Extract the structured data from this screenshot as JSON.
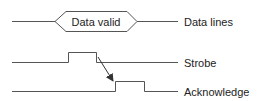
{
  "diagram": {
    "type": "timing-diagram",
    "colors": {
      "line": "#555555",
      "text": "#222222",
      "background": "#ffffff"
    },
    "data_bus": {
      "box_label": "Data valid",
      "signal_label": "Data lines"
    },
    "strobe": {
      "signal_label": "Strobe"
    },
    "acknowledge": {
      "signal_label": "Acknowledge"
    },
    "arrow": {
      "from": "strobe-falling-edge",
      "to": "acknowledge-rising-edge"
    }
  }
}
